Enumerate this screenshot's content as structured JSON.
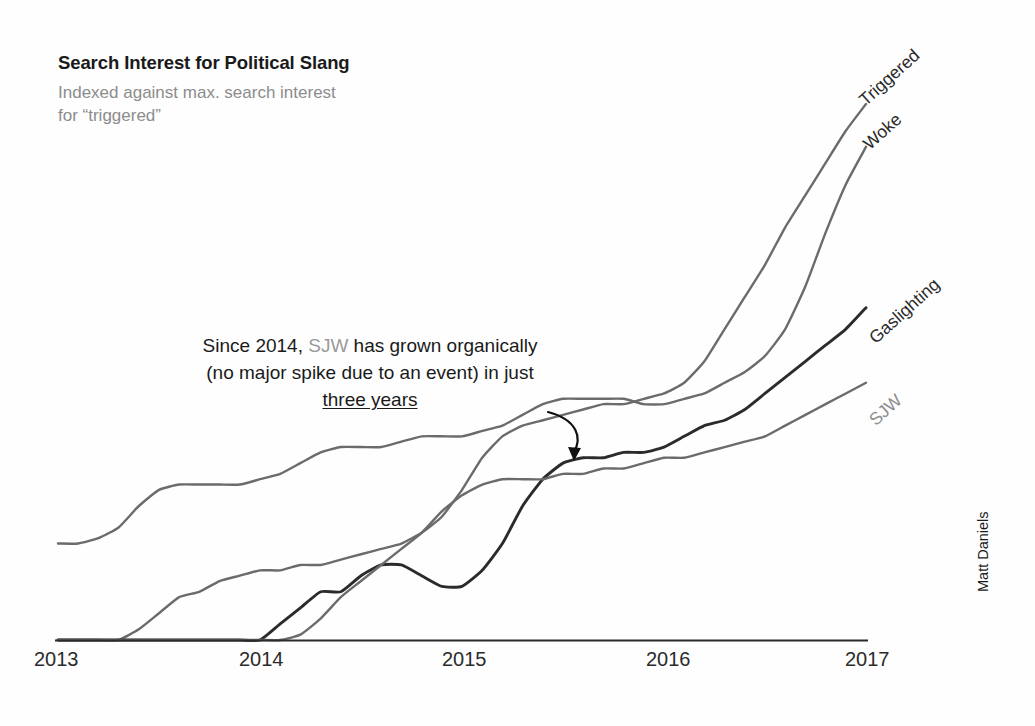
{
  "header": {
    "title": "Search Interest for Political Slang",
    "subtitle": "Indexed against max. search interest for “triggered”"
  },
  "annotation": {
    "part1": "Since 2014, ",
    "highlight": "SJW",
    "part2": " has grown organically (no major spike due to an event) in just ",
    "underlined": "three years",
    "full_text": "Since 2014, SJW has grown organically (no major spike due to an event) in just three years"
  },
  "credit": "Matt Daniels",
  "colors": {
    "dark_line": "#2b2b2b",
    "gray_line": "#6b6b6b",
    "axis": "#2b2b2b",
    "subtitle": "#8c8c8c",
    "highlight_gray": "#9a9a9a"
  },
  "chart_data": {
    "type": "line",
    "title": "Search Interest for Political Slang",
    "subtitle": "Indexed against max. search interest for “triggered”",
    "xlabel": "",
    "ylabel": "",
    "xlim": [
      2013,
      2017
    ],
    "ylim": [
      0,
      100
    ],
    "grid": false,
    "legend_position": "end-of-line-labels",
    "tick_labels": [
      "2013",
      "2014",
      "2015",
      "2016",
      "2017"
    ],
    "x_ticks": [
      2013,
      2014,
      2015,
      2016,
      2017
    ],
    "annotations": [
      {
        "text": "Since 2014, SJW has grown organically (no major spike due to an event) in just three years",
        "points_to": "SJW series near 2015.5",
        "arrow": true
      }
    ],
    "series": [
      {
        "name": "Triggered",
        "color": "#6b6b6b",
        "label_style": "dark",
        "x": [
          2013.0,
          2013.1,
          2013.2,
          2013.3,
          2013.4,
          2013.5,
          2013.6,
          2013.7,
          2013.8,
          2013.9,
          2014.0,
          2014.1,
          2014.2,
          2014.3,
          2014.4,
          2014.5,
          2014.6,
          2014.7,
          2014.8,
          2014.9,
          2015.0,
          2015.1,
          2015.2,
          2015.3,
          2015.4,
          2015.5,
          2015.6,
          2015.7,
          2015.8,
          2015.9,
          2016.0,
          2016.1,
          2016.2,
          2016.3,
          2016.4,
          2016.5,
          2016.6,
          2016.7,
          2016.8,
          2016.9,
          2017.0
        ],
        "values": [
          0,
          0,
          0,
          0,
          2,
          5,
          8,
          9,
          11,
          12,
          13,
          13,
          14,
          14,
          15,
          16,
          17,
          18,
          20,
          23,
          28,
          34,
          38,
          40,
          41,
          42,
          43,
          44,
          44,
          45,
          46,
          48,
          52,
          58,
          64,
          70,
          77,
          83,
          89,
          95,
          100
        ]
      },
      {
        "name": "Woke",
        "color": "#6b6b6b",
        "label_style": "dark",
        "x": [
          2013.0,
          2013.1,
          2013.2,
          2013.3,
          2013.4,
          2013.5,
          2013.6,
          2013.7,
          2013.8,
          2013.9,
          2014.0,
          2014.1,
          2014.2,
          2014.3,
          2014.4,
          2014.5,
          2014.6,
          2014.7,
          2014.8,
          2014.9,
          2015.0,
          2015.1,
          2015.2,
          2015.3,
          2015.4,
          2015.5,
          2015.6,
          2015.7,
          2015.8,
          2015.9,
          2016.0,
          2016.1,
          2016.2,
          2016.3,
          2016.4,
          2016.5,
          2016.6,
          2016.7,
          2016.8,
          2016.9,
          2017.0
        ],
        "values": [
          18,
          18,
          19,
          21,
          25,
          28,
          29,
          29,
          29,
          29,
          30,
          31,
          33,
          35,
          36,
          36,
          36,
          37,
          38,
          38,
          38,
          39,
          40,
          42,
          44,
          45,
          45,
          45,
          45,
          44,
          44,
          45,
          46,
          48,
          50,
          53,
          58,
          66,
          76,
          85,
          92
        ]
      },
      {
        "name": "Gaslighting",
        "color": "#2b2b2b",
        "label_style": "dark",
        "x": [
          2013.0,
          2013.1,
          2013.2,
          2013.3,
          2013.4,
          2013.5,
          2013.6,
          2013.7,
          2013.8,
          2013.9,
          2014.0,
          2014.1,
          2014.2,
          2014.3,
          2014.4,
          2014.5,
          2014.6,
          2014.7,
          2014.8,
          2014.9,
          2015.0,
          2015.1,
          2015.2,
          2015.3,
          2015.4,
          2015.5,
          2015.6,
          2015.7,
          2015.8,
          2015.9,
          2016.0,
          2016.1,
          2016.2,
          2016.3,
          2016.4,
          2016.5,
          2016.6,
          2016.7,
          2016.8,
          2016.9,
          2017.0
        ],
        "values": [
          0,
          0,
          0,
          0,
          0,
          0,
          0,
          0,
          0,
          0,
          0,
          3,
          6,
          9,
          9,
          12,
          14,
          14,
          12,
          10,
          10,
          13,
          18,
          25,
          30,
          33,
          34,
          34,
          35,
          35,
          36,
          38,
          40,
          41,
          43,
          46,
          49,
          52,
          55,
          58,
          62
        ]
      },
      {
        "name": "SJW",
        "color": "#6b6b6b",
        "label_style": "gray",
        "x": [
          2013.0,
          2013.1,
          2013.2,
          2013.3,
          2013.4,
          2013.5,
          2013.6,
          2013.7,
          2013.8,
          2013.9,
          2014.0,
          2014.1,
          2014.2,
          2014.3,
          2014.4,
          2014.5,
          2014.6,
          2014.7,
          2014.8,
          2014.9,
          2015.0,
          2015.1,
          2015.2,
          2015.3,
          2015.4,
          2015.5,
          2015.6,
          2015.7,
          2015.8,
          2015.9,
          2016.0,
          2016.1,
          2016.2,
          2016.3,
          2016.4,
          2016.5,
          2016.6,
          2016.7,
          2016.8,
          2016.9,
          2017.0
        ],
        "values": [
          0,
          0,
          0,
          0,
          0,
          0,
          0,
          0,
          0,
          0,
          0,
          0,
          1,
          4,
          8,
          11,
          14,
          17,
          20,
          24,
          27,
          29,
          30,
          30,
          30,
          31,
          31,
          32,
          32,
          33,
          34,
          34,
          35,
          36,
          37,
          38,
          40,
          42,
          44,
          46,
          48
        ]
      }
    ],
    "series_labels": [
      {
        "name": "Triggered",
        "style": "dark"
      },
      {
        "name": "Woke",
        "style": "dark"
      },
      {
        "name": "Gaslighting",
        "style": "dark"
      },
      {
        "name": "SJW",
        "style": "gray"
      }
    ]
  }
}
